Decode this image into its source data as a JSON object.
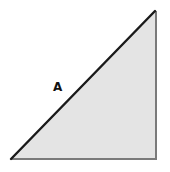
{
  "diagram": {
    "type": "right-triangle",
    "vertices": {
      "top": [
        155,
        11
      ],
      "bottom_left": [
        11,
        159
      ],
      "bottom_right": [
        156,
        159
      ]
    },
    "fill_color": "#e4e4e4",
    "hypotenuse_color": "#1a1a1a",
    "leg_color": "#7a7a7a",
    "labels": [
      {
        "text": "A",
        "x": 53,
        "y": 91,
        "refers_to": "hypotenuse"
      }
    ]
  }
}
